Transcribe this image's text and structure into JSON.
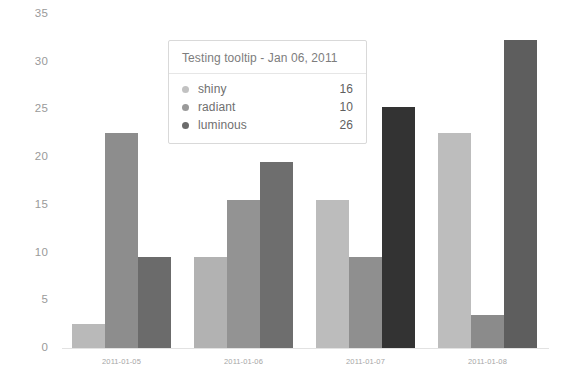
{
  "chart_data": {
    "type": "bar",
    "title": "",
    "xlabel": "",
    "ylabel": "",
    "categories": [
      "2011-01-05",
      "2011-01-06",
      "2011-01-07",
      "2011-01-08"
    ],
    "series": [
      {
        "name": "shiny",
        "color": "#b9b9b9",
        "values": [
          2.5,
          9.5,
          15.5,
          22.5
        ]
      },
      {
        "name": "radiant",
        "color": "#8d8d8d",
        "values": [
          22.5,
          15.5,
          9.5,
          3.5
        ]
      },
      {
        "name": "luminous",
        "color": "#5c5c5c",
        "values": [
          9.5,
          19.5,
          25.3,
          32.3
        ]
      }
    ],
    "ylim": [
      0,
      35
    ],
    "yticks": [
      0,
      5,
      10,
      15,
      20,
      25,
      30,
      35
    ],
    "ytick_labels": [
      "0",
      "5",
      "10",
      "15",
      "20",
      "25",
      "30",
      "35"
    ],
    "grid": false,
    "legend": "none",
    "bar_colors_by_group": [
      [
        "#b9b9b9",
        "#8d8d8d",
        "#6b6b6b"
      ],
      [
        "#b2b2b2",
        "#939393",
        "#6e6e6e"
      ],
      [
        "#bcbcbc",
        "#8f8f8f",
        "#333333"
      ],
      [
        "#bdbdbd",
        "#8b8b8b",
        "#5e5e5e"
      ]
    ]
  },
  "tooltip": {
    "title": "Testing tooltip - Jan 06, 2011",
    "rows": [
      {
        "label": "shiny",
        "value": "16",
        "dot_color": "#c2c2c2"
      },
      {
        "label": "radiant",
        "value": "10",
        "dot_color": "#9a9a9a"
      },
      {
        "label": "luminous",
        "value": "26",
        "dot_color": "#6b6b6b"
      }
    ]
  }
}
